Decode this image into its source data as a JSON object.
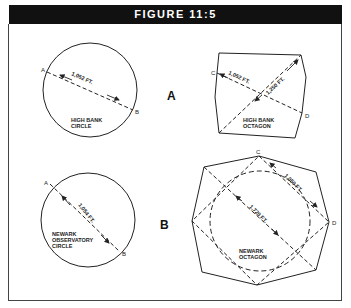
{
  "figure": {
    "title": "FIGURE 11:5"
  },
  "panel_a": {
    "label": "A",
    "circle": {
      "name_line1": "HIGH BANK",
      "name_line2": "CIRCLE",
      "diameter_label": "1,052 FT.",
      "point_start": "A",
      "point_end": "B"
    },
    "octagon": {
      "name_line1": "HIGH BANK",
      "name_line2": "OCTAGON",
      "diagonal_label": "1,052 FT.",
      "cross_label": "1,250 FT.",
      "point_start": "C",
      "point_end": "D"
    }
  },
  "panel_b": {
    "label": "B",
    "circle": {
      "name_line1": "NEWARK",
      "name_line2": "OBSERVATORY",
      "name_line3": "CIRCLE",
      "diameter_label": "1,054 FT.",
      "point_start": "A",
      "point_end": "B"
    },
    "octagon": {
      "name_line1": "NEWARK",
      "name_line2": "OCTAGON",
      "side_label": "1,050 FT.",
      "diagonal_label": "1,720 FT.",
      "point_start": "C",
      "point_end": "D"
    }
  }
}
